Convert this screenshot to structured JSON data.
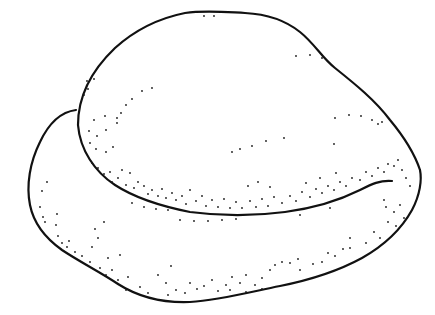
{
  "illustration": {
    "subject": "stippled line drawing of two overlapping rounded forms",
    "colors": {
      "background": "#ffffff",
      "ink": "#111111"
    }
  }
}
